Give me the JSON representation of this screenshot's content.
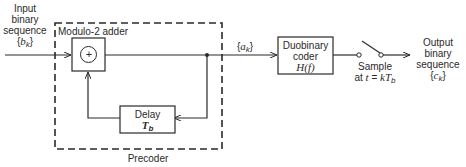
{
  "diagram": {
    "input": {
      "line1": "Input",
      "line2": "binary",
      "line3": "sequence",
      "symbol_open": "{",
      "symbol_var": "b",
      "symbol_sub": "k",
      "symbol_close": "}"
    },
    "precoder": {
      "label": "Precoder",
      "adder_label": "Modulo-2 adder",
      "adder_symbol": "+",
      "delay_line1": "Delay",
      "delay_var": "T",
      "delay_sub": "b"
    },
    "intermediate": {
      "symbol_open": "{",
      "symbol_var": "a",
      "symbol_sub": "k",
      "symbol_close": "}"
    },
    "duobinary": {
      "line1": "Duobinary",
      "line2": "coder",
      "line3": "H(f)"
    },
    "sampler": {
      "line1": "Sample",
      "line2_prefix": "at ",
      "line2_t": "t",
      "line2_eq": " = ",
      "line2_k": "kT",
      "line2_sub": "b"
    },
    "output": {
      "line1": "Output",
      "line2": "binary",
      "line3": "sequence",
      "symbol_open": "{",
      "symbol_var": "c",
      "symbol_sub": "k",
      "symbol_close": "}"
    },
    "colors": {
      "stroke": "#2a2a2a",
      "background": "#ffffff"
    }
  }
}
